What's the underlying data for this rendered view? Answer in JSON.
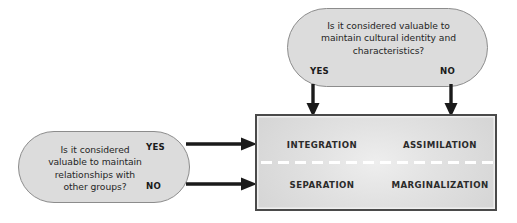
{
  "diagram": {
    "background_color": "#ffffff",
    "box_fill_color": "#dcdcdc",
    "matrix_fill_color": "#e2e2e2",
    "arrow_color": "#1a1a1a"
  },
  "top_question": {
    "text": "Is it considered valuable to\nmaintain cultural identity and\ncharacteristics?",
    "yes_label": "YES",
    "no_label": "NO"
  },
  "left_question": {
    "text": "Is it considered\nvaluable to maintain\nrelationships with\nother groups?",
    "yes_label": "YES",
    "no_label": "NO"
  },
  "matrix": {
    "cells": [
      {
        "id": "integration",
        "label": "INTEGRATION"
      },
      {
        "id": "assimilation",
        "label": "ASSIMILATION"
      },
      {
        "id": "separation",
        "label": "SEPARATION"
      },
      {
        "id": "marginalization",
        "label": "MARGINALIZATION"
      }
    ]
  }
}
